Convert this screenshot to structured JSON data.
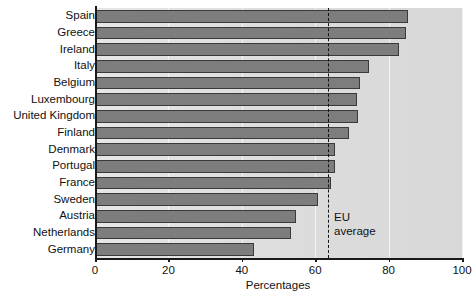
{
  "chart_data": {
    "type": "bar",
    "orientation": "horizontal",
    "title": "",
    "xlabel": "Percentages",
    "ylabel": "",
    "xlim": [
      0,
      100
    ],
    "xticks": [
      0,
      20,
      40,
      60,
      80,
      100
    ],
    "xticklabels": [
      "0",
      "20",
      "40",
      "60",
      "80",
      "100"
    ],
    "grid": true,
    "grid_axis": "x",
    "legend": "none",
    "categories": [
      "Spain",
      "Greece",
      "Ireland",
      "Italy",
      "Belgium",
      "Luxembourg",
      "United Kingdom",
      "Finland",
      "Denmark",
      "Portugal",
      "France",
      "Sweden",
      "Austria",
      "Netherlands",
      "Germany"
    ],
    "values": [
      85,
      84.5,
      82.5,
      74.5,
      72,
      71,
      71.5,
      69,
      65,
      65,
      64,
      60.5,
      54.5,
      53,
      43
    ],
    "annotations": [
      {
        "name": "eu-average",
        "label": "EU\naverage",
        "label_line_1": "EU",
        "label_line_2": "average",
        "type": "vertical-dashed-line",
        "value": 63.5
      }
    ],
    "colors": {
      "bar_fill": "#7d7d7d",
      "bar_edge": "#3a3a3a",
      "plot_background": "#dedede",
      "gridline": "#f4f4f4",
      "axis": "#1a1a1a",
      "text": "#111111"
    }
  }
}
